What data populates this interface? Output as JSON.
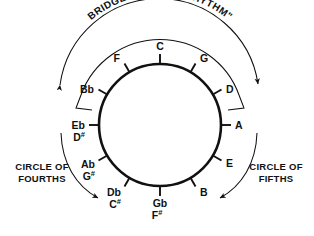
{
  "diagram": {
    "bridge_label": "BRIDGE TO \"I GOT RHYTHM\"",
    "left_label_line1": "CIRCLE OF",
    "left_label_line2": "FOURTHS",
    "right_label_line1": "CIRCLE OF",
    "right_label_line2": "FIFTHS",
    "colors": {
      "background": "#ffffff",
      "ink": "#111111",
      "circle_stroke": "#111111",
      "thin_stroke": "#222222"
    },
    "circle": {
      "center_x": 160,
      "center_y": 125,
      "radius": 61,
      "stroke_width": 2.6
    },
    "notes": [
      {
        "id": "note-c",
        "primary": "C",
        "accidental": "",
        "alt_primary": "",
        "alt_accidental": "",
        "angle_deg": 0
      },
      {
        "id": "note-g",
        "primary": "G",
        "accidental": "",
        "alt_primary": "",
        "alt_accidental": "",
        "angle_deg": 30
      },
      {
        "id": "note-d",
        "primary": "D",
        "accidental": "",
        "alt_primary": "",
        "alt_accidental": "",
        "angle_deg": 60
      },
      {
        "id": "note-a",
        "primary": "A",
        "accidental": "",
        "alt_primary": "",
        "alt_accidental": "",
        "angle_deg": 90
      },
      {
        "id": "note-e",
        "primary": "E",
        "accidental": "",
        "alt_primary": "",
        "alt_accidental": "",
        "angle_deg": 120
      },
      {
        "id": "note-b",
        "primary": "B",
        "accidental": "",
        "alt_primary": "",
        "alt_accidental": "",
        "angle_deg": 150
      },
      {
        "id": "note-gb",
        "primary": "Gb",
        "accidental": "",
        "alt_primary": "F",
        "alt_accidental": "#",
        "angle_deg": 180
      },
      {
        "id": "note-db",
        "primary": "Db",
        "accidental": "",
        "alt_primary": "C",
        "alt_accidental": "#",
        "angle_deg": 210
      },
      {
        "id": "note-ab",
        "primary": "Ab",
        "accidental": "",
        "alt_primary": "G",
        "alt_accidental": "#",
        "angle_deg": 240
      },
      {
        "id": "note-eb",
        "primary": "Eb",
        "accidental": "",
        "alt_primary": "D",
        "alt_accidental": "#",
        "angle_deg": 270
      },
      {
        "id": "note-bb",
        "primary": "Bb",
        "accidental": "",
        "alt_primary": "",
        "alt_accidental": "",
        "angle_deg": 300
      },
      {
        "id": "note-f",
        "primary": "F",
        "accidental": "",
        "alt_primary": "",
        "alt_accidental": "",
        "angle_deg": 330
      }
    ],
    "note_order_clockwise": [
      "C",
      "G",
      "D",
      "A",
      "E",
      "B",
      "Gb/F#",
      "Db/C#",
      "Ab/G#",
      "Eb/D#",
      "Bb",
      "F"
    ]
  }
}
